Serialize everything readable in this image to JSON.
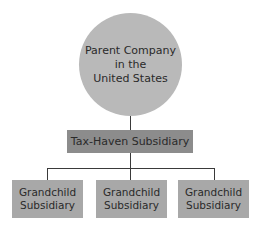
{
  "diagram": {
    "type": "org-chart",
    "root": {
      "label": "Parent Company in the United States",
      "lines": [
        "Parent Company",
        "in the",
        "United States"
      ]
    },
    "middle": {
      "label": "Tax-Haven Subsidiary"
    },
    "leaves": [
      {
        "lines": [
          "Grandchild",
          "Subsidiary"
        ]
      },
      {
        "lines": [
          "Grandchild",
          "Subsidiary"
        ]
      },
      {
        "lines": [
          "Grandchild",
          "Subsidiary"
        ]
      }
    ],
    "colors": {
      "root_fill": "#b9b9b9",
      "middle_fill": "#8c8c8c",
      "leaf_fill": "#a8a8a8",
      "connector": "#3a3a3a"
    }
  }
}
